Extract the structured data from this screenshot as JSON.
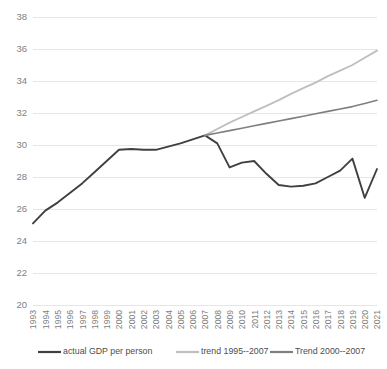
{
  "chart_data": {
    "type": "line",
    "title": "",
    "xlabel": "",
    "ylabel": "",
    "ylim": [
      20,
      38
    ],
    "ytick_step": 2,
    "yticks": [
      "20",
      "22",
      "24",
      "26",
      "28",
      "30",
      "32",
      "34",
      "36",
      "38"
    ],
    "grid": true,
    "legend_position": "bottom",
    "categories": [
      "1993",
      "1994",
      "1995",
      "1996",
      "1997",
      "1998",
      "1999",
      "2000",
      "2001",
      "2002",
      "2003",
      "2004",
      "2005",
      "2006",
      "2007",
      "2008",
      "2009",
      "2010",
      "2011",
      "2012",
      "2013",
      "2014",
      "2015",
      "2016",
      "2017",
      "2018",
      "2019",
      "2020",
      "2021"
    ],
    "series": [
      {
        "name": "actual GDP per person",
        "color": "#404040",
        "width": 1.9,
        "values": [
          25.1,
          25.9,
          26.4,
          27.0,
          27.6,
          28.3,
          29.0,
          29.7,
          29.75,
          29.7,
          29.7,
          29.9,
          30.1,
          30.35,
          30.6,
          30.1,
          28.6,
          28.9,
          29.0,
          28.2,
          27.5,
          27.4,
          27.45,
          27.6,
          28.0,
          28.4,
          29.15,
          26.7,
          28.5
        ]
      },
      {
        "name": "trend 1995--2007",
        "color": "#bfbfbf",
        "width": 1.9,
        "values": [
          null,
          null,
          null,
          null,
          null,
          null,
          null,
          null,
          null,
          null,
          null,
          null,
          null,
          null,
          30.6,
          31.0,
          31.4,
          31.75,
          32.1,
          32.45,
          32.8,
          33.2,
          33.55,
          33.9,
          34.3,
          34.65,
          35.0,
          35.45,
          35.9
        ]
      },
      {
        "name": "Trend 2000--2007",
        "color": "#7f7f7f",
        "width": 1.6,
        "values": [
          null,
          null,
          null,
          null,
          null,
          null,
          null,
          null,
          null,
          null,
          null,
          null,
          null,
          null,
          30.6,
          30.75,
          30.9,
          31.05,
          31.2,
          31.35,
          31.5,
          31.65,
          31.8,
          31.95,
          32.1,
          32.25,
          32.4,
          32.6,
          32.8
        ]
      }
    ],
    "legend": [
      {
        "label": "actual GDP per person",
        "color": "#404040"
      },
      {
        "label": "trend 1995--2007",
        "color": "#bfbfbf"
      },
      {
        "label": "Trend 2000--2007",
        "color": "#7f7f7f"
      }
    ]
  },
  "layout": {
    "plot_left": 33,
    "plot_right": 377,
    "plot_top": 17,
    "plot_bottom": 305
  }
}
